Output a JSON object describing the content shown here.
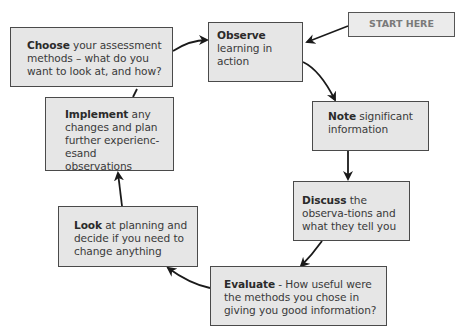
{
  "diagram": {
    "type": "cycle-flowchart",
    "start": {
      "label": "START HERE"
    },
    "steps": [
      {
        "id": "observe",
        "bold": "Observe",
        "text": " learning in action"
      },
      {
        "id": "note",
        "bold": "Note",
        "text": " significant information"
      },
      {
        "id": "discuss",
        "bold": "Discuss",
        "text": " the observa-tions and what they tell you"
      },
      {
        "id": "evaluate",
        "bold": "Evaluate",
        "text": " - How useful were the methods you chose in giving you good information?"
      },
      {
        "id": "look",
        "bold": "Look",
        "text": " at planning and decide if you need to change anything"
      },
      {
        "id": "implement",
        "bold": "Implement",
        "text": " any changes and plan further experienc-esand observations"
      },
      {
        "id": "choose",
        "bold": "Choose",
        "text": " your assessment methods – what do you want to look at, and how?"
      }
    ],
    "flow": [
      "start",
      "observe",
      "note",
      "discuss",
      "evaluate",
      "look",
      "implement",
      "choose",
      "observe"
    ],
    "colors": {
      "box_fill": "#e6e6e6",
      "box_border": "#4a4a4a",
      "arrow": "#1a1a1a",
      "start_text": "#7a7a7a"
    }
  }
}
